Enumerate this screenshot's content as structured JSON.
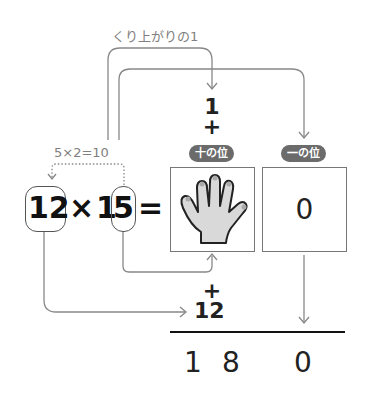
{
  "carry_label": "くり上がりの1",
  "carry_digit": "1",
  "plus_top": "+",
  "hint": "5×2=10",
  "equation": {
    "left": "12",
    "times": "×",
    "right_prefix": "1",
    "right_highlight": "5",
    "equals": "="
  },
  "place_labels": {
    "tens": "十の位",
    "ones": "一の位"
  },
  "ones_digit": "0",
  "plus_bottom": "+",
  "addend": "12",
  "result": [
    "1",
    "8",
    "0"
  ],
  "colors": {
    "line": "#888888",
    "badge": "#6b6b6b",
    "hand_fill": "#d9d9d9"
  }
}
